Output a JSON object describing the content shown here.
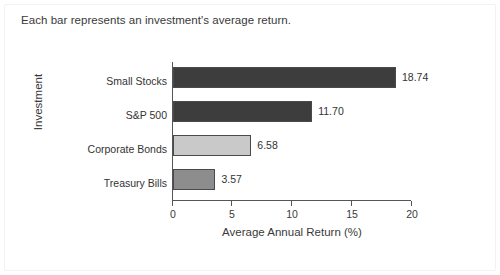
{
  "caption": "Each bar represents an investment's average return.",
  "chart_data": {
    "type": "bar",
    "orientation": "horizontal",
    "title": "",
    "xlabel": "Average Annual Return (%)",
    "ylabel": "Investment",
    "xlim": [
      0,
      20
    ],
    "xticks": [
      0,
      5,
      10,
      15,
      20
    ],
    "xtick_labels": [
      "0",
      "5",
      "10",
      "15",
      "20"
    ],
    "grid": false,
    "legend": false,
    "categories": [
      "Small Stocks",
      "S&P 500",
      "Corporate Bonds",
      "Treasury Bills"
    ],
    "values": [
      18.74,
      11.7,
      6.58,
      3.57
    ],
    "value_labels": [
      "18.74",
      "11.70",
      "6.58",
      "3.57"
    ],
    "bar_colors": [
      "#3d3d3d",
      "#3d3d3d",
      "#c9c9c9",
      "#8d8d8d"
    ],
    "bar_edge_color": "#4a4a4a"
  },
  "colors": {
    "text": "#3a3a3a",
    "axis": "#555555",
    "background": "#ffffff",
    "frame": "#f2f2f2"
  }
}
